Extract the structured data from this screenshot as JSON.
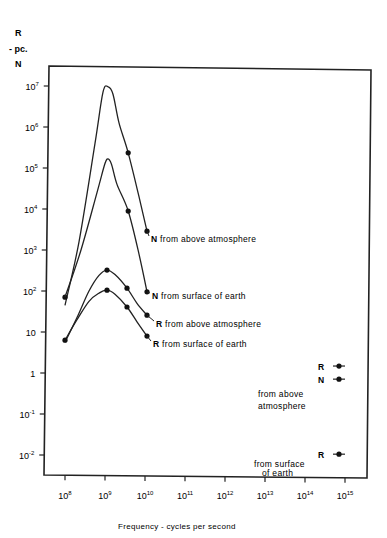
{
  "chart_data": {
    "type": "line",
    "title": "",
    "ylabel": "R - pc. N",
    "ylabel_lines": [
      "R",
      "- pc.",
      "N"
    ],
    "xlabel": "Frequency - cycles per second",
    "xscale": "log",
    "yscale": "log",
    "xlim": [
      100000000.0,
      1000000000000000.0
    ],
    "ylim": [
      0.01,
      10000000.0
    ],
    "grid": false,
    "x_ticks": [
      {
        "base": "10",
        "exp": "8"
      },
      {
        "base": "10",
        "exp": "9"
      },
      {
        "base": "10",
        "exp": "10"
      },
      {
        "base": "10",
        "exp": "11"
      },
      {
        "base": "10",
        "exp": "12"
      },
      {
        "base": "10",
        "exp": "13"
      },
      {
        "base": "10",
        "exp": "14"
      },
      {
        "base": "10",
        "exp": "15"
      }
    ],
    "y_ticks": [
      {
        "base": "10",
        "exp": "7",
        "log": 7
      },
      {
        "base": "10",
        "exp": "6",
        "log": 6
      },
      {
        "base": "10",
        "exp": "5",
        "log": 5
      },
      {
        "base": "10",
        "exp": "4",
        "log": 4
      },
      {
        "base": "10",
        "exp": "3",
        "log": 3
      },
      {
        "base": "10",
        "exp": "2",
        "log": 2
      },
      {
        "base": "10",
        "exp": "",
        "log": 1
      },
      {
        "base": "1",
        "exp": "",
        "log": 0
      },
      {
        "base": "10",
        "exp": "-1",
        "log": -1
      },
      {
        "base": "10",
        "exp": "-2",
        "log": -2
      }
    ],
    "series": [
      {
        "name": "N from above atmosphere",
        "label_parts": [
          "N",
          " from above atmosphere"
        ],
        "curve_log": [
          [
            8.0,
            1.65
          ],
          [
            8.35,
            3.2
          ],
          [
            8.75,
            5.6
          ],
          [
            8.95,
            6.85
          ],
          [
            9.08,
            6.98
          ],
          [
            9.2,
            6.8
          ],
          [
            9.35,
            6.1
          ],
          [
            9.58,
            5.37
          ],
          [
            9.85,
            4.3
          ],
          [
            10.05,
            3.46
          ]
        ],
        "points": [
          {
            "f": 100000000.0,
            "v": 70
          },
          {
            "f": 3800000000.0,
            "v": 230000
          },
          {
            "f": 11000000000.0,
            "v": 2900
          }
        ],
        "marker_log": [
          [
            8.0,
            1.85
          ],
          [
            9.58,
            5.37
          ],
          [
            10.05,
            3.46
          ]
        ],
        "label_pos": {
          "x": 151,
          "y": 242
        }
      },
      {
        "name": "N from surface of earth",
        "label_parts": [
          "N",
          " from surface of earth"
        ],
        "curve_log": [
          [
            8.0,
            1.85
          ],
          [
            8.4,
            3.0
          ],
          [
            8.8,
            4.4
          ],
          [
            8.98,
            5.05
          ],
          [
            9.06,
            5.22
          ],
          [
            9.16,
            5.1
          ],
          [
            9.3,
            4.6
          ],
          [
            9.58,
            3.95
          ],
          [
            9.85,
            2.9
          ],
          [
            10.05,
            1.98
          ]
        ],
        "points": [
          {
            "f": 1200000000.0,
            "v": 170000
          },
          {
            "f": 3800000000.0,
            "v": 9000
          },
          {
            "f": 11000000000.0,
            "v": 95
          }
        ],
        "marker_log": [
          [
            9.58,
            3.95
          ],
          [
            10.05,
            1.98
          ]
        ],
        "label_pos": {
          "x": 152,
          "y": 299
        }
      },
      {
        "name": "R from above atmosphere",
        "label_parts": [
          "R",
          " from above atmosphere"
        ],
        "curve_log": [
          [
            8.0,
            0.75
          ],
          [
            8.3,
            1.35
          ],
          [
            8.6,
            2.0
          ],
          [
            8.85,
            2.38
          ],
          [
            9.05,
            2.51
          ],
          [
            9.25,
            2.4
          ],
          [
            9.55,
            2.07
          ],
          [
            9.8,
            1.7
          ],
          [
            10.05,
            1.41
          ]
        ],
        "points": [
          {
            "f": 1000000000.0,
            "v": 320
          },
          {
            "f": 3500000000.0,
            "v": 120
          },
          {
            "f": 11000000000.0,
            "v": 26
          }
        ],
        "marker_log": [
          [
            9.05,
            2.51
          ],
          [
            9.55,
            2.07
          ],
          [
            10.05,
            1.41
          ]
        ],
        "label_pos": {
          "x": 156,
          "y": 327
        }
      },
      {
        "name": "R from surface of earth",
        "label_parts": [
          "R",
          " from surface of earth"
        ],
        "curve_log": [
          [
            8.0,
            0.8
          ],
          [
            8.3,
            1.3
          ],
          [
            8.6,
            1.75
          ],
          [
            8.85,
            1.95
          ],
          [
            9.05,
            2.02
          ],
          [
            9.25,
            1.92
          ],
          [
            9.55,
            1.61
          ],
          [
            9.8,
            1.25
          ],
          [
            10.05,
            0.9
          ]
        ],
        "points": [
          {
            "f": 100000000.0,
            "v": 6
          },
          {
            "f": 1000000000.0,
            "v": 100
          },
          {
            "f": 3500000000.0,
            "v": 40
          },
          {
            "f": 11000000000.0,
            "v": 8
          }
        ],
        "marker_log": [
          [
            8.0,
            0.8
          ],
          [
            9.05,
            2.02
          ],
          [
            9.55,
            1.61
          ],
          [
            10.05,
            0.9
          ]
        ],
        "label_pos": {
          "x": 153,
          "y": 347
        }
      }
    ],
    "annotations": [
      {
        "id": "legend-R-above",
        "text": "R",
        "marker_log": [
          14.85,
          0.17
        ],
        "x": 318,
        "y": 370
      },
      {
        "id": "legend-N-above",
        "text": "N",
        "marker_log": [
          14.85,
          -0.15
        ],
        "x": 318,
        "y": 383
      },
      {
        "id": "legend-above-caption-1",
        "text": "from above",
        "x": 258,
        "y": 397
      },
      {
        "id": "legend-above-caption-2",
        "text": "atmosphere",
        "x": 258,
        "y": 409
      },
      {
        "id": "legend-R-surface",
        "text": "R",
        "marker_log": [
          14.85,
          -1.98
        ],
        "x": 318,
        "y": 458
      },
      {
        "id": "legend-surface-caption-1",
        "text": "from surface",
        "x": 254,
        "y": 467
      },
      {
        "id": "legend-surface-caption-2",
        "text": "of earth",
        "x": 262,
        "y": 476
      }
    ]
  }
}
